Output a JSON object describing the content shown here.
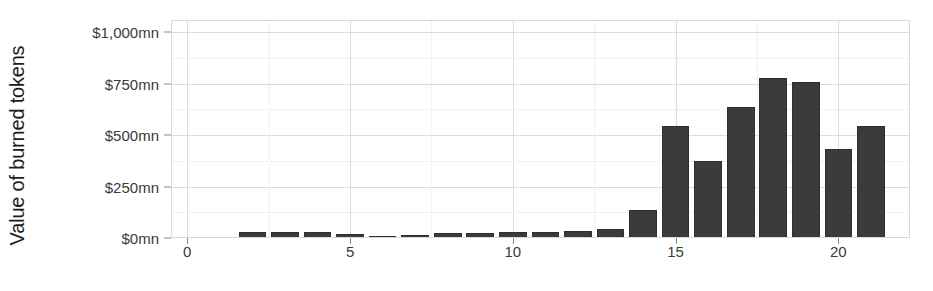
{
  "chart_data": {
    "type": "bar",
    "title": "",
    "xlabel": "",
    "ylabel": "Value of burned tokens",
    "x": [
      2,
      3,
      4,
      5,
      6,
      7,
      8,
      9,
      10,
      11,
      12,
      13,
      14,
      15,
      16,
      17,
      18,
      19,
      20,
      21
    ],
    "values": [
      30,
      28,
      27,
      18,
      10,
      17,
      22,
      26,
      28,
      30,
      33,
      42,
      135,
      545,
      375,
      635,
      780,
      760,
      435,
      545
    ],
    "xlim": [
      -0.5,
      22.2
    ],
    "ylim": [
      0,
      1060
    ],
    "y_ticks": [
      0,
      250,
      500,
      750,
      1000
    ],
    "y_tick_labels": [
      "$0mn",
      "$250mn",
      "$500mn",
      "$750mn",
      "$1,000mn"
    ],
    "y_minor_ticks": [
      125,
      375,
      625,
      875
    ],
    "x_ticks": [
      0,
      5,
      10,
      15,
      20
    ],
    "x_tick_labels": [
      "0",
      "5",
      "10",
      "15",
      "20"
    ],
    "x_minor_ticks": [
      2.5,
      7.5,
      12.5,
      17.5
    ],
    "grid": true,
    "legend": null,
    "bar_color": "#3b3b3b",
    "bar_edge_color": "#2e2e2e",
    "bar_width": 0.85
  }
}
